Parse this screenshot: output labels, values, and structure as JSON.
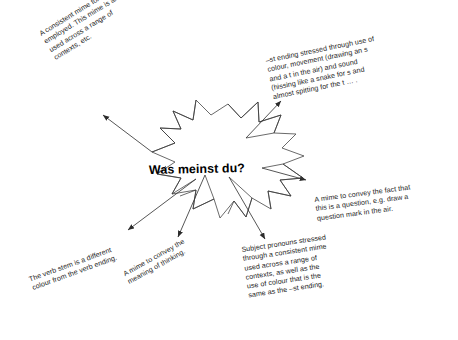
{
  "diagram": {
    "type": "starburst-mind-map",
    "center": {
      "label": "Was meinst du?",
      "shape": "starburst",
      "shape_name": "explosion-burst",
      "stroke_color": "#4a4a4a",
      "fill_color": "#ffffff",
      "text_color": "#000000"
    },
    "background_color": "#ffffff",
    "arrow_color": "#333333",
    "notes": [
      {
        "id": "note-top-left",
        "position": "top-left",
        "rotation_deg": -31.5,
        "text": "A consistent mime for was is\nemployed. This mime is also\nused across a range of\ncontexts, etc."
      },
      {
        "id": "note-top-right",
        "position": "top-right",
        "rotation_deg": -11.5,
        "text": "–st ending stressed through use of\ncolour, movement (drawing an s\nand a t in the air) and sound\n(hissing like a snake for s and\nalmost spitting for the t … ."
      },
      {
        "id": "note-right",
        "position": "right",
        "rotation_deg": -7.5,
        "text": "A mime to convey the fact that\nthis is a question, e.g. draw a\nquestion mark in the air."
      },
      {
        "id": "note-bottom-right",
        "position": "bottom-right",
        "rotation_deg": -8.5,
        "text": "Subject pronouns stressed\nthrough a consistent mime\nused across a range of\ncontexts, as well as the\nuse of colour that is the\nsame as the –st ending."
      },
      {
        "id": "note-bottom-centre",
        "position": "bottom-centre",
        "rotation_deg": -29,
        "text": "A mime to convey the\nmeaning of thinking."
      },
      {
        "id": "note-bottom-left",
        "position": "bottom-left",
        "rotation_deg": -20,
        "text": "The verb stem is a different\ncolour from the verb ending."
      }
    ]
  }
}
